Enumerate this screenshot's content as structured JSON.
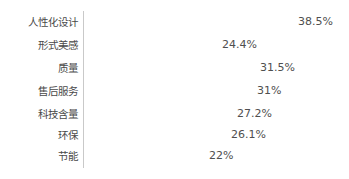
{
  "chart_data": {
    "type": "bar",
    "orientation": "horizontal",
    "title": "",
    "subtitle": "",
    "xlabel": "",
    "ylabel": "",
    "grid": false,
    "legend_position": "none",
    "xlim": [
      0,
      38.5
    ],
    "axis_line": true,
    "value_suffix": "%",
    "categories": [
      "人性化设计",
      "形式美感",
      "质量",
      "售后服务",
      "科技含量",
      "环保",
      "节能"
    ],
    "values": [
      38.5,
      24.4,
      31.5,
      31,
      27.2,
      26.1,
      22
    ],
    "value_labels": [
      "38.5%",
      "24.4%",
      "31.5%",
      "31%",
      "27.2%",
      "26.1%",
      "22%"
    ],
    "colors": {
      "bar": "#9d9d9d",
      "bar_highlight": "#c2c2c2",
      "axis": "#c9c9c9",
      "label_text": "#4a4a4a",
      "value_text": "#4f4f4f",
      "background": "#ffffff"
    }
  }
}
